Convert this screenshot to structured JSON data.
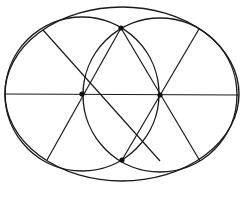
{
  "diagram": {
    "type": "geometric-construction",
    "stroke_color": "#1a1a1a",
    "background": "#ffffff",
    "ellipse": {
      "cx": 122,
      "cy": 94,
      "rx": 117,
      "ry": 87
    },
    "circles": [
      {
        "name": "left-circle",
        "cx": 82,
        "cy": 94,
        "r": 77
      },
      {
        "name": "right-circle",
        "cx": 160,
        "cy": 95,
        "r": 77
      }
    ],
    "points": [
      {
        "name": "left-center",
        "x": 82,
        "y": 94
      },
      {
        "name": "right-center",
        "x": 160,
        "y": 95
      },
      {
        "name": "top-intersection",
        "x": 121,
        "y": 28
      },
      {
        "name": "bottom-intersection",
        "x": 122,
        "y": 160
      }
    ],
    "lines": [
      {
        "name": "horizontal-axis",
        "x1": 5,
        "y1": 94,
        "x2": 239,
        "y2": 95
      },
      {
        "name": "left-spoke-upper",
        "x1": 43,
        "y1": 30,
        "x2": 160,
        "y2": 161
      },
      {
        "name": "left-spoke-lower",
        "x1": 47,
        "y1": 160,
        "x2": 121,
        "y2": 28
      },
      {
        "name": "right-spoke-upper",
        "x1": 199,
        "y1": 29,
        "x2": 122,
        "y2": 160
      },
      {
        "name": "right-spoke-lower",
        "x1": 200,
        "y1": 161,
        "x2": 121,
        "y2": 28
      }
    ]
  }
}
